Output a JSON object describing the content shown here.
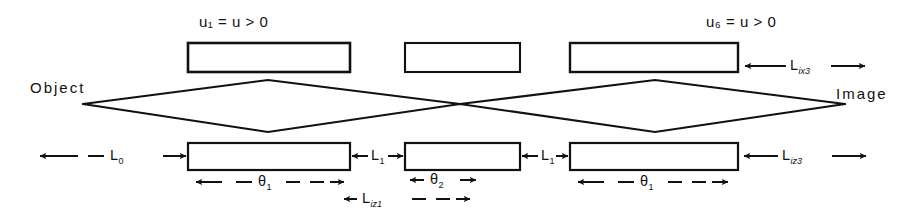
{
  "figure": {
    "ink_color": "#111111",
    "background_color": "#ffffff",
    "object_label": "Object",
    "image_label": "Image"
  },
  "top_lenses": [
    {
      "id": "top-lens-1",
      "label": "u₁ = u > 0",
      "has_label": true
    },
    {
      "id": "top-lens-2",
      "label": "",
      "has_label": false
    },
    {
      "id": "top-lens-3",
      "label": "u₆ = u > 0",
      "has_label": true
    }
  ],
  "top_labels": {
    "lens1_u": {
      "base": "u",
      "sub": "1",
      "rest": " = u > 0"
    },
    "lens3_u": {
      "base": "u",
      "sub": "6",
      "rest": " = u > 0"
    }
  },
  "top_dimension": {
    "name": "L_ix3",
    "base": "L",
    "sub": "ix3",
    "style": "dashed-double-arrow"
  },
  "bottom_lenses": [
    {
      "id": "bottom-lens-1",
      "theta": {
        "base": "θ",
        "sub": "1"
      },
      "theta_style": "dashed-double-arrow"
    },
    {
      "id": "bottom-lens-2",
      "theta": {
        "base": "θ",
        "sub": "2"
      },
      "theta_style": "solid-double-arrow"
    },
    {
      "id": "bottom-lens-3",
      "theta": {
        "base": "θ",
        "sub": "1"
      },
      "theta_style": "dashed-double-arrow"
    }
  ],
  "bottom_dimensions": [
    {
      "id": "dim-L0",
      "base": "L",
      "sub": "0",
      "style": "dashed-double-arrow"
    },
    {
      "id": "dim-L1-a",
      "base": "L",
      "sub": "1",
      "style": "solid-double-arrow"
    },
    {
      "id": "dim-L1-b",
      "base": "L",
      "sub": "1",
      "style": "solid-double-arrow"
    },
    {
      "id": "dim-Liz3",
      "base": "L",
      "sub": "iz3",
      "style": "dashed-double-arrow"
    },
    {
      "id": "dim-Liz1",
      "base": "L",
      "sub": "iz1",
      "style": "dashed-double-arrow"
    }
  ],
  "geometry": {
    "axis_y": 104,
    "object_point_x": 83,
    "image_point_x": 845,
    "crossover_x": 460,
    "top_row_y": [
      43,
      72
    ],
    "bottom_row_y": [
      143,
      170
    ],
    "lens_spans_top": [
      [
        188,
        350
      ],
      [
        405,
        520
      ],
      [
        570,
        738
      ]
    ],
    "lens_spans_bottom": [
      [
        188,
        350
      ],
      [
        405,
        520
      ],
      [
        570,
        738
      ]
    ]
  }
}
